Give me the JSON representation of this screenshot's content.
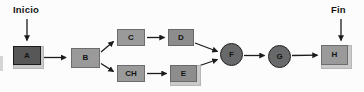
{
  "labels": {
    "start": "Inicio",
    "end": "Fin"
  },
  "nodes": {
    "a": {
      "label": "A",
      "shape": "framed-rect"
    },
    "b": {
      "label": "B",
      "shape": "rect"
    },
    "c": {
      "label": "C",
      "shape": "rect"
    },
    "d": {
      "label": "D",
      "shape": "rect"
    },
    "ch": {
      "label": "CH",
      "shape": "rect"
    },
    "e": {
      "label": "E",
      "shape": "framed-rect"
    },
    "f": {
      "label": "F",
      "shape": "circle"
    },
    "g": {
      "label": "G",
      "shape": "circle"
    },
    "h": {
      "label": "H",
      "shape": "framed-rect"
    }
  },
  "edges": [
    {
      "from": "Inicio",
      "to": "A"
    },
    {
      "from": "A",
      "to": "B"
    },
    {
      "from": "B",
      "to": "C"
    },
    {
      "from": "B",
      "to": "CH"
    },
    {
      "from": "C",
      "to": "D"
    },
    {
      "from": "CH",
      "to": "E"
    },
    {
      "from": "D",
      "to": "F"
    },
    {
      "from": "E",
      "to": "F"
    },
    {
      "from": "F",
      "to": "G"
    },
    {
      "from": "G",
      "to": "H"
    },
    {
      "from": "Fin",
      "to": "H"
    }
  ],
  "colors": {
    "background": "#fcfcfc",
    "node_dark": "#575757",
    "node_medium": "#9a9a9a",
    "node_medium_dark": "#8d8d8d",
    "circle_fill": "#67696b",
    "frame": "#cacaca",
    "arrow": "#1c1c1c",
    "ink": "#141414"
  }
}
